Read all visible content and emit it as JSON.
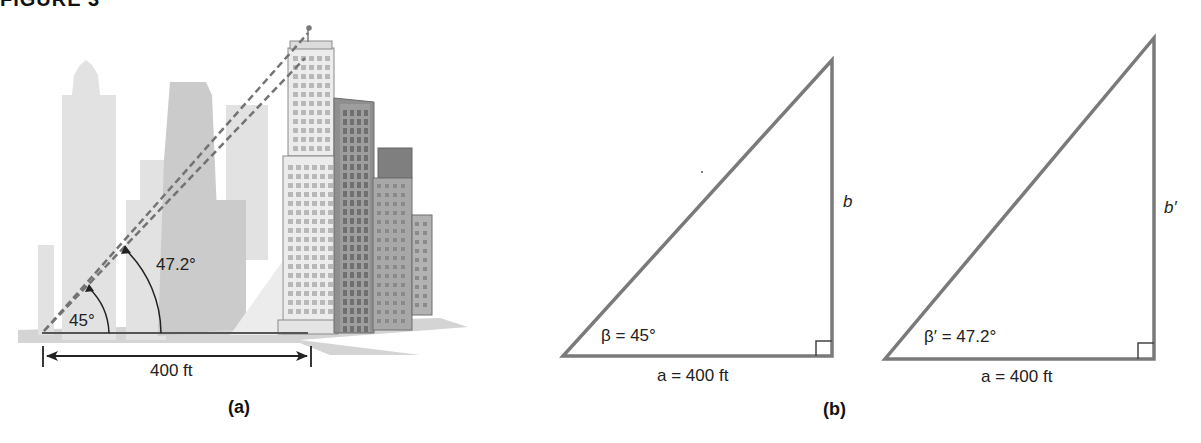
{
  "figure": {
    "title": "FIGURE 3",
    "panels": [
      {
        "id": "a",
        "caption": "(a)",
        "description": "City skyline illustration with observer on top of a tall building; two dashed lines of sight from a ground point",
        "angle_small": "45°",
        "angle_large": "47.2°",
        "distance": "400 ft"
      },
      {
        "id": "b",
        "caption": "(b)",
        "triangles": [
          {
            "angle_label": "β = 45°",
            "base_label": "a = 400 ft",
            "side_label": "b"
          },
          {
            "angle_label": "β′ = 47.2°",
            "base_label": "a = 400 ft",
            "side_label": "b′"
          }
        ]
      }
    ]
  },
  "colors": {
    "line": "#7a7a7a",
    "dash": "#6e6e6e",
    "building_light": "#d9d9d9",
    "building_mid": "#bdbdbd",
    "building_dark": "#8c8c8c",
    "ground": "#cfcfcf"
  }
}
